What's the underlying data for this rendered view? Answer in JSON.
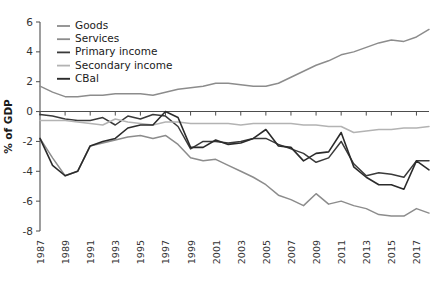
{
  "chart_data": {
    "type": "line",
    "title": "",
    "xlabel": "",
    "ylabel": "% of GDP",
    "ylim": [
      -8,
      6
    ],
    "yticks": [
      -8,
      -6,
      -4,
      -2,
      0,
      2,
      4,
      6
    ],
    "ytick_labels": [
      "-8",
      "-6",
      "-4",
      "-2",
      "0",
      "2",
      "4",
      "6"
    ],
    "grid": false,
    "legend_position": "top-left",
    "x": [
      1987,
      1988,
      1989,
      1990,
      1991,
      1992,
      1993,
      1994,
      1995,
      1996,
      1997,
      1998,
      1999,
      2000,
      2001,
      2002,
      2003,
      2004,
      2005,
      2006,
      2007,
      2008,
      2009,
      2010,
      2011,
      2012,
      2013,
      2014,
      2015,
      2016,
      2017,
      2018
    ],
    "xtick_labels": [
      "1987",
      "1989",
      "1991",
      "1993",
      "1995",
      "1997",
      "1999",
      "2001",
      "2003",
      "2005",
      "2007",
      "2009",
      "2011",
      "2013",
      "2015",
      "2017"
    ],
    "xticks": [
      1987,
      1989,
      1991,
      1993,
      1995,
      1997,
      1999,
      2001,
      2003,
      2005,
      2007,
      2009,
      2011,
      2013,
      2015,
      2017
    ],
    "series": [
      {
        "name": "Goods",
        "color": "#8c8c8c",
        "width": 1.5,
        "values": [
          -1.8,
          -3.1,
          -4.3,
          -4.0,
          -2.3,
          -2.1,
          -1.9,
          -1.7,
          -1.6,
          -1.8,
          -1.6,
          -2.2,
          -3.1,
          -3.3,
          -3.2,
          -3.6,
          -4.0,
          -4.4,
          -4.9,
          -5.6,
          -5.9,
          -6.3,
          -5.5,
          -6.2,
          -6.0,
          -6.3,
          -6.5,
          -6.9,
          -7.0,
          -7.0,
          -6.5,
          -6.8
        ]
      },
      {
        "name": "Services",
        "color": "#8c8c8c",
        "width": 1.5,
        "values": [
          1.7,
          1.3,
          1.0,
          1.0,
          1.1,
          1.1,
          1.2,
          1.2,
          1.2,
          1.1,
          1.3,
          1.5,
          1.6,
          1.7,
          1.9,
          1.9,
          1.8,
          1.7,
          1.7,
          1.9,
          2.3,
          2.7,
          3.1,
          3.4,
          3.8,
          4.0,
          4.3,
          4.6,
          4.8,
          4.7,
          5.0,
          5.5
        ]
      },
      {
        "name": "Primary income",
        "color": "#3a3a3a",
        "width": 1.5,
        "values": [
          -0.2,
          -0.3,
          -0.5,
          -0.6,
          -0.6,
          -0.4,
          -0.9,
          -0.3,
          -0.5,
          -0.2,
          -0.3,
          -1.0,
          -2.5,
          -2.0,
          -2.0,
          -2.1,
          -2.0,
          -1.8,
          -1.8,
          -2.2,
          -2.5,
          -2.8,
          -3.4,
          -3.1,
          -2.0,
          -3.5,
          -4.3,
          -4.1,
          -4.2,
          -4.4,
          -3.3,
          -3.3
        ]
      },
      {
        "name": "Secondary income",
        "color": "#b3b3b3",
        "width": 1.5,
        "values": [
          -0.6,
          -0.6,
          -0.6,
          -0.7,
          -0.8,
          -0.9,
          -0.5,
          -0.7,
          -0.8,
          -0.9,
          -0.7,
          -0.7,
          -0.8,
          -0.8,
          -0.8,
          -0.8,
          -0.9,
          -0.8,
          -0.8,
          -0.8,
          -0.8,
          -0.9,
          -0.9,
          -1.0,
          -1.0,
          -1.4,
          -1.3,
          -1.2,
          -1.2,
          -1.1,
          -1.1,
          -1.0
        ]
      },
      {
        "name": "CBal",
        "color": "#2b2b2b",
        "width": 1.6,
        "values": [
          -1.8,
          -3.6,
          -4.3,
          -4.0,
          -2.3,
          -2.0,
          -1.8,
          -1.1,
          -0.9,
          -0.9,
          0.0,
          -0.4,
          -2.4,
          -2.4,
          -1.9,
          -2.2,
          -2.1,
          -1.8,
          -1.2,
          -2.3,
          -2.4,
          -3.3,
          -2.8,
          -2.7,
          -1.4,
          -3.7,
          -4.4,
          -4.9,
          -4.9,
          -5.2,
          -3.3,
          -3.9
        ]
      }
    ]
  }
}
